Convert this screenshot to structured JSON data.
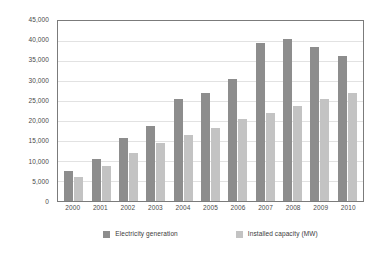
{
  "chart_data": {
    "type": "bar",
    "title": "",
    "subtitle": "",
    "xlabel": "",
    "ylabel": "",
    "categories": [
      "2000",
      "2001",
      "2002",
      "2003",
      "2004",
      "2005",
      "2006",
      "2007",
      "2008",
      "2009",
      "2010"
    ],
    "series": [
      {
        "name": "Electricity generation",
        "color": "#8d8d8d",
        "values": [
          7500,
          10500,
          15700,
          18700,
          25500,
          27100,
          30600,
          39400,
          40400,
          38500,
          36300
        ]
      },
      {
        "name": "Installed capacity (MW)",
        "color": "#c3c3c3",
        "values": [
          6100,
          8800,
          11900,
          14500,
          16500,
          18300,
          20500,
          22100,
          23700,
          25500,
          27000
        ]
      }
    ],
    "ylim": [
      0,
      45000
    ],
    "ytick_step": 5000,
    "ytick_labels": [
      "45,000",
      "40,000",
      "35,000",
      "30,000",
      "25,000",
      "20,000",
      "15,000",
      "10,000",
      "5,000",
      "0"
    ],
    "ytick_values": [
      45000,
      40000,
      35000,
      30000,
      25000,
      20000,
      15000,
      10000,
      5000,
      0
    ],
    "grid": true,
    "grid_axis": "y",
    "legend_position": "bottom",
    "legend_entries": [
      "Electricity generation",
      "Installed capacity (MW)"
    ],
    "plot_background": "#ffffff",
    "grid_color": "#e2e2e2",
    "axis_color": "#7b7b7b",
    "text_color": "#3a3a3a"
  }
}
